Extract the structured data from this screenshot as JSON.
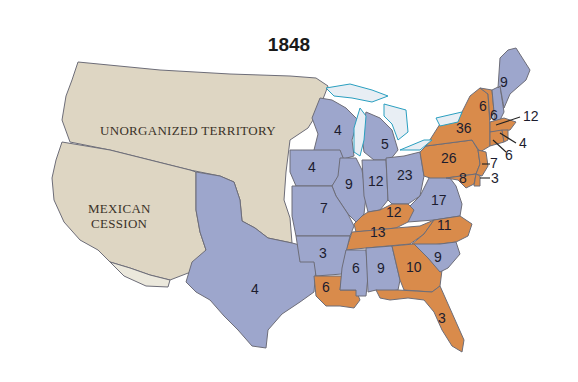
{
  "title": "1848",
  "colors": {
    "party_orange": "#d98b4b",
    "party_blue": "#9da6cc",
    "territory": "#ded6c3",
    "lakes": "#e8eef4",
    "water_edge": "#2a9fc0"
  },
  "territories": [
    {
      "id": "unorganized-territory",
      "label": "UNORGANIZED TERRITORY"
    },
    {
      "id": "mexican-cession",
      "label_line1": "MEXICAN",
      "label_line2": "CESSION"
    }
  ],
  "states": [
    {
      "id": "maine",
      "votes": "9",
      "party": "blue"
    },
    {
      "id": "vermont",
      "votes": "6",
      "party": "orange"
    },
    {
      "id": "new-hampshire",
      "votes": "6",
      "party": "blue"
    },
    {
      "id": "massachusetts",
      "votes": "12",
      "party": "orange"
    },
    {
      "id": "rhode-island",
      "votes": "4",
      "party": "orange"
    },
    {
      "id": "connecticut",
      "votes": "6",
      "party": "orange"
    },
    {
      "id": "new-york",
      "votes": "36",
      "party": "orange"
    },
    {
      "id": "new-jersey",
      "votes": "7",
      "party": "orange"
    },
    {
      "id": "pennsylvania",
      "votes": "26",
      "party": "orange"
    },
    {
      "id": "delaware",
      "votes": "3",
      "party": "orange"
    },
    {
      "id": "maryland",
      "votes": "8",
      "party": "orange"
    },
    {
      "id": "wisconsin",
      "votes": "4",
      "party": "blue"
    },
    {
      "id": "michigan",
      "votes": "5",
      "party": "blue"
    },
    {
      "id": "iowa",
      "votes": "4",
      "party": "blue"
    },
    {
      "id": "illinois",
      "votes": "9",
      "party": "blue"
    },
    {
      "id": "indiana",
      "votes": "12",
      "party": "blue"
    },
    {
      "id": "ohio",
      "votes": "23",
      "party": "blue"
    },
    {
      "id": "virginia",
      "votes": "17",
      "party": "blue"
    },
    {
      "id": "missouri",
      "votes": "7",
      "party": "blue"
    },
    {
      "id": "kentucky",
      "votes": "12",
      "party": "orange"
    },
    {
      "id": "tennessee",
      "votes": "13",
      "party": "orange"
    },
    {
      "id": "north-carolina",
      "votes": "11",
      "party": "orange"
    },
    {
      "id": "arkansas",
      "votes": "3",
      "party": "blue"
    },
    {
      "id": "south-carolina",
      "votes": "9",
      "party": "blue"
    },
    {
      "id": "mississippi",
      "votes": "6",
      "party": "blue"
    },
    {
      "id": "alabama",
      "votes": "9",
      "party": "blue"
    },
    {
      "id": "georgia",
      "votes": "10",
      "party": "orange"
    },
    {
      "id": "louisiana",
      "votes": "6",
      "party": "orange"
    },
    {
      "id": "florida",
      "votes": "3",
      "party": "orange"
    },
    {
      "id": "texas",
      "votes": "4",
      "party": "blue"
    }
  ]
}
